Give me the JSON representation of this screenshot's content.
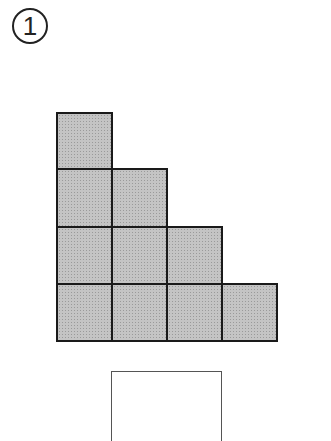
{
  "problem": {
    "number_label": "1"
  },
  "figure": {
    "rows": [
      1,
      2,
      3,
      4
    ],
    "fill_color": "#c4c4c4",
    "border_color": "#1a1a1a"
  },
  "answer_box": {
    "value": ""
  }
}
